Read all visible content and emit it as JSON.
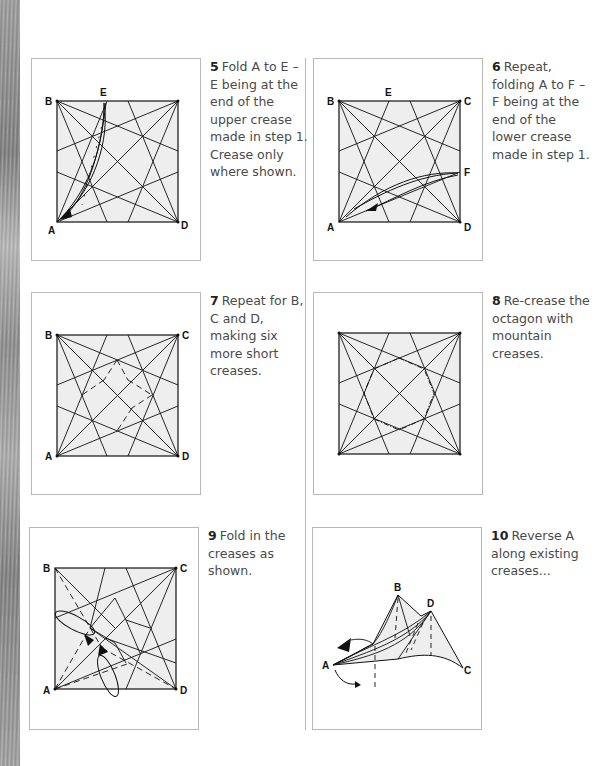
{
  "page": {
    "background": "#ffffff",
    "diagram_fill": "#eeeeee",
    "line_color": "#111111"
  },
  "steps": [
    {
      "number": "5",
      "text": "Fold A to E – E being at the end of the upper crease made in step 1. Crease only where shown.",
      "labels": {
        "b": "B",
        "e": "E",
        "a": "A",
        "d": "D"
      }
    },
    {
      "number": "6",
      "text": "Repeat, folding A to F – F being at the end of the lower crease made in step 1.",
      "labels": {
        "b": "B",
        "e": "E",
        "c": "C",
        "f": "F",
        "a": "A",
        "d": "D"
      }
    },
    {
      "number": "7",
      "text": "Repeat for B, C and D, making six more short creases.",
      "labels": {
        "b": "B",
        "c": "C",
        "a": "A",
        "d": "D"
      }
    },
    {
      "number": "8",
      "text": "Re-crease the octagon with mountain creases.",
      "labels": {}
    },
    {
      "number": "9",
      "text": "Fold in the creases as shown.",
      "labels": {
        "b": "B",
        "c": "C",
        "a": "A",
        "d": "D"
      }
    },
    {
      "number": "10",
      "text": "Reverse A along existing creases...",
      "labels": {
        "b": "B",
        "d": "D",
        "a": "A",
        "c": "C"
      }
    }
  ]
}
